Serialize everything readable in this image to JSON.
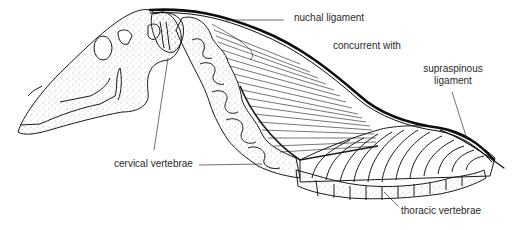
{
  "diagram": {
    "colors": {
      "line": "#1a1a1a",
      "ligament": "#0d0d0d",
      "label_text": "#2a2a2a",
      "stipple": "#555555",
      "background": "#ffffff"
    },
    "labels": {
      "nuchal_ligament": "nuchal ligament",
      "concurrent_with": "concurrent with",
      "supraspinous_line1": "supraspinous",
      "supraspinous_line2": "ligament",
      "cervical_vertebrae": "cervical vertebrae",
      "thoracic_vertebrae": "thoracic vertebrae"
    }
  }
}
